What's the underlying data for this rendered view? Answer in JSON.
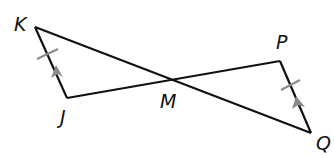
{
  "diagram": {
    "type": "geometry",
    "points": {
      "K": {
        "label": "K",
        "x": 35,
        "y": 27
      },
      "J": {
        "label": "J",
        "x": 67,
        "y": 98
      },
      "M": {
        "label": "M",
        "x": 174,
        "y": 79
      },
      "P": {
        "label": "P",
        "x": 280,
        "y": 61
      },
      "Q": {
        "label": "Q",
        "x": 311,
        "y": 133
      }
    },
    "segments": [
      "KQ",
      "JP",
      "KJ",
      "PQ"
    ],
    "markings": {
      "KJ": [
        "tick",
        "parallel-arrow"
      ],
      "PQ": [
        "tick",
        "parallel-arrow"
      ]
    },
    "colors": {
      "line": "#111111",
      "marking": "#8a8a8a"
    }
  }
}
